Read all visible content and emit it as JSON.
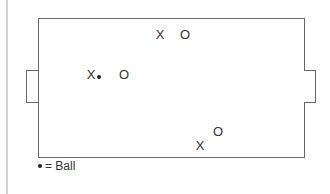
{
  "diagram": {
    "type": "soccer-field-positions",
    "markers": [
      {
        "label": "X",
        "team": "X",
        "x": 160,
        "y": 34
      },
      {
        "label": "O",
        "team": "O",
        "x": 185,
        "y": 34
      },
      {
        "label": "X",
        "team": "X",
        "x": 91,
        "y": 74
      },
      {
        "label": "O",
        "team": "O",
        "x": 124,
        "y": 74
      },
      {
        "label": "O",
        "team": "O",
        "x": 218,
        "y": 131
      },
      {
        "label": "X",
        "team": "X",
        "x": 200,
        "y": 145
      }
    ],
    "ball": {
      "x": 99,
      "y": 77
    },
    "legend": {
      "symbol": "•",
      "text": "= Ball"
    }
  }
}
